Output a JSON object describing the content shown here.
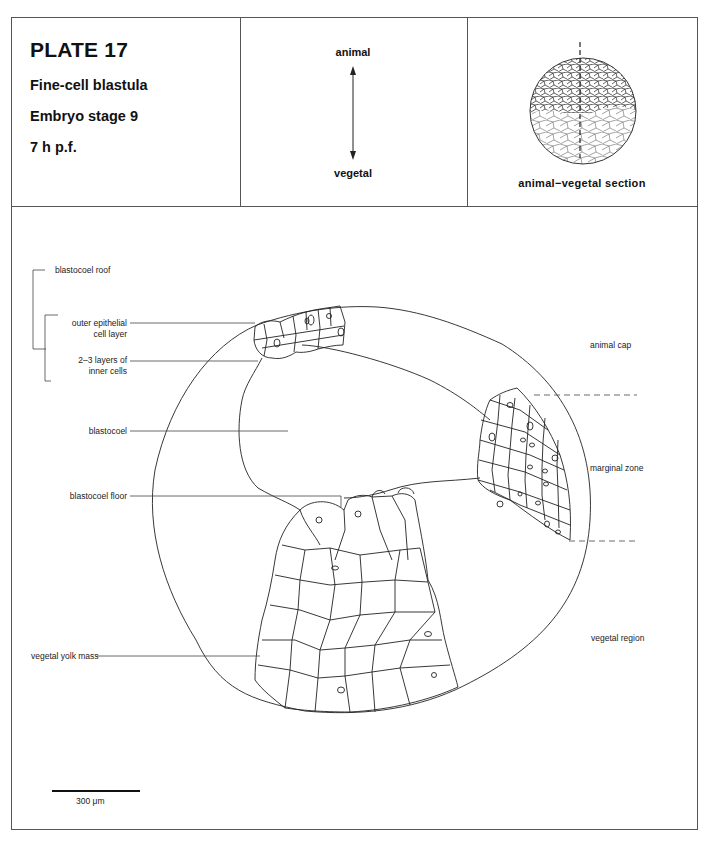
{
  "plate": {
    "title": "PLATE 17",
    "stage_name": "Fine-cell blastula",
    "stage": "Embryo stage 9",
    "time": "7 h  p.f."
  },
  "orientation": {
    "top_label": "animal",
    "bottom_label": "vegetal",
    "arrow_icon": "double-headed-vertical-arrow"
  },
  "section_view": {
    "caption": "animal−vegetal section",
    "icon": "embryo-sphere-with-section-line"
  },
  "left_labels": {
    "blastocoel_roof": "blastocoel roof",
    "outer_epithelial_1": "outer epithelial",
    "outer_epithelial_2": "cell layer",
    "inner_layers_1": "2–3 layers of",
    "inner_layers_2": "inner cells",
    "blastocoel": "blastocoel",
    "blastocoel_floor": "blastocoel floor",
    "vegetal_yolk_mass": "vegetal yolk mass"
  },
  "right_labels": {
    "animal_cap": "animal cap",
    "marginal_zone": "marginal zone",
    "vegetal_region": "vegetal region"
  },
  "scale_bar": {
    "label": "300 μm"
  },
  "colors": {
    "line": "#222222",
    "frame": "#555555",
    "background": "#ffffff"
  }
}
